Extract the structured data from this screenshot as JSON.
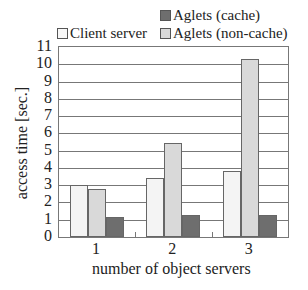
{
  "chart_data": {
    "type": "bar",
    "title": "",
    "xlabel": "number of object servers",
    "ylabel": "access time [sec.]",
    "ylim": [
      0,
      11
    ],
    "yticks": [
      0,
      1,
      2,
      3,
      4,
      5,
      6,
      7,
      8,
      9,
      10,
      11
    ],
    "grid": true,
    "legend_position": "top",
    "categories": [
      "1",
      "2",
      "3"
    ],
    "series": [
      {
        "name": "Client server",
        "color": "#f4f4f4",
        "values": [
          3.0,
          3.4,
          3.8
        ]
      },
      {
        "name": "Aglets (non-cache)",
        "color": "#d9d9d9",
        "values": [
          2.8,
          5.45,
          10.3
        ]
      },
      {
        "name": "Aglets (cache)",
        "color": "#6e6e6e",
        "values": [
          1.15,
          1.25,
          1.25
        ]
      }
    ]
  },
  "legend": {
    "client_server": "Client server",
    "aglets_cache": "Aglets (cache)",
    "aglets_noncache": "Aglets (non-cache)"
  },
  "axes": {
    "xlabel": "number of object servers",
    "ylabel": "access time [sec.]"
  }
}
